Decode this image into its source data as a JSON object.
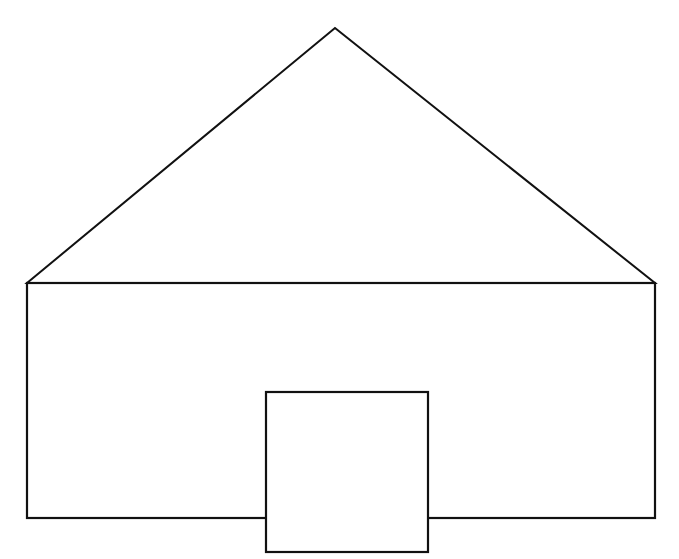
{
  "diagram": {
    "type": "line-drawing",
    "stroke_color": "#111111",
    "background": "#ffffff",
    "stroke_width": 2,
    "shapes": {
      "roof": {
        "shape": "triangle",
        "apex": [
          335,
          28
        ],
        "left": [
          27,
          283
        ],
        "right": [
          655,
          283
        ]
      },
      "walls": {
        "shape": "rectangle",
        "x": 27,
        "y": 283,
        "width": 628,
        "height": 235
      },
      "door": {
        "shape": "rectangle",
        "x": 266,
        "y": 392,
        "width": 162,
        "height": 160
      }
    }
  }
}
